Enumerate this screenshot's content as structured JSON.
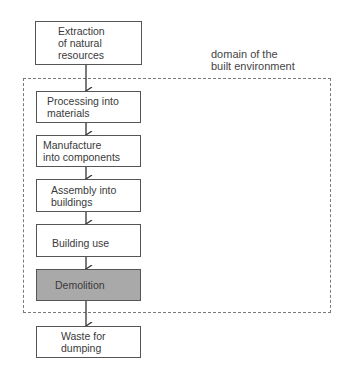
{
  "diagram": {
    "domain_label": "domain of the\nbuilt environment",
    "steps": [
      {
        "label": "Extraction\nof natural\nresources",
        "shaded": false
      },
      {
        "label": "Processing into\nmaterials",
        "shaded": false
      },
      {
        "label": "Manufacture\ninto components",
        "shaded": false
      },
      {
        "label": "Assembly into\nbuildings",
        "shaded": false
      },
      {
        "label": "Building use",
        "shaded": false
      },
      {
        "label": "Demolition",
        "shaded": true
      },
      {
        "label": "Waste for\ndumping",
        "shaded": false
      }
    ],
    "colors": {
      "highlight_fill": "#a9a9a9",
      "border": "#555555"
    }
  }
}
